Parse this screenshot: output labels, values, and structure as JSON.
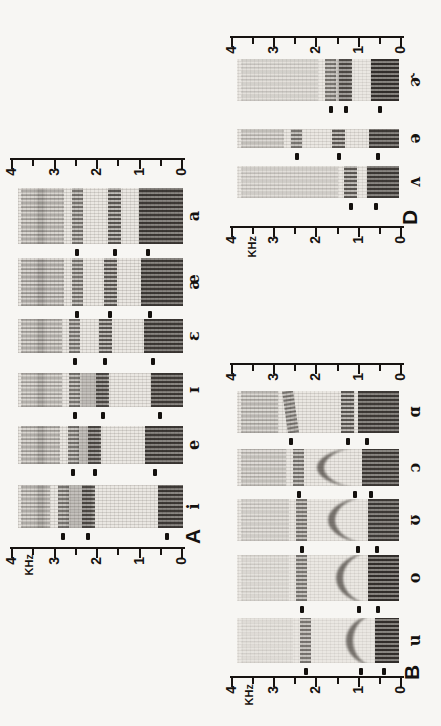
{
  "page": {
    "background": "#f7f6f3",
    "ink": "#171310",
    "strip_base": "#eae7e2"
  },
  "chart_data": {
    "type": "heatmap",
    "subtype": "speech_spectrograms_of_vowels",
    "orientation": "figure_rotated_90deg_ccw_on_page",
    "frequency_axis": {
      "label": "KHz",
      "min": 0,
      "max": 4,
      "tick_labels": [
        "4",
        "3",
        "2",
        "1",
        "0"
      ],
      "minor_tick_step": 0.5
    },
    "panels": [
      {
        "label": "A",
        "vowels": [
          {
            "ipa": "i",
            "formants_khz": [
              0.35,
              2.21,
              2.8
            ],
            "trajectory": "flat",
            "high_freq_energy": 0.65
          },
          {
            "ipa": "e",
            "formants_khz": [
              0.64,
              2.05,
              2.56
            ],
            "trajectory": "flat",
            "high_freq_energy": 0.65
          },
          {
            "ipa": "ɪ",
            "formants_khz": [
              0.52,
              1.86,
              2.52
            ],
            "trajectory": "flat",
            "high_freq_energy": 0.6
          },
          {
            "ipa": "ɛ",
            "formants_khz": [
              0.68,
              1.81,
              2.52
            ],
            "trajectory": "flat",
            "high_freq_energy": 0.65
          },
          {
            "ipa": "æ",
            "formants_khz": [
              0.75,
              1.69,
              2.47
            ],
            "trajectory": "flat",
            "high_freq_energy": 0.7
          },
          {
            "ipa": "a",
            "formants_khz": [
              0.8,
              1.58,
              2.47
            ],
            "trajectory": "flat",
            "high_freq_energy": 0.65
          }
        ]
      },
      {
        "label": "B",
        "vowels": [
          {
            "ipa": "u",
            "formants_khz": [
              0.4,
              0.95,
              2.25
            ],
            "trajectory": "arch",
            "high_freq_energy": 0.12
          },
          {
            "ipa": "o",
            "formants_khz": [
              0.55,
              1.0,
              2.35
            ],
            "trajectory": "arch",
            "high_freq_energy": 0.18
          },
          {
            "ipa": "ʊ",
            "formants_khz": [
              0.56,
              1.02,
              2.35
            ],
            "trajectory": "arch",
            "high_freq_energy": 0.3
          },
          {
            "ipa": "ɔ",
            "formants_khz": [
              0.7,
              1.09,
              2.42
            ],
            "trajectory": "arch",
            "high_freq_energy": 0.45
          },
          {
            "ipa": "ɑ",
            "formants_khz": [
              0.8,
              1.26,
              2.61
            ],
            "trajectory": "rise",
            "high_freq_energy": 0.55
          }
        ]
      },
      {
        "label": "D",
        "vowels": [
          {
            "ipa": "ʌ",
            "formants_khz": [
              0.58,
              1.19
            ],
            "trajectory": "flat",
            "high_freq_energy": 0.3
          },
          {
            "ipa": "ə",
            "formants_khz": [
              0.54,
              1.47,
              2.46
            ],
            "trajectory": "flat",
            "high_freq_energy": 0.45
          },
          {
            "ipa": "ɚ",
            "formants_khz": [
              0.49,
              1.31,
              1.66
            ],
            "trajectory": "flat",
            "high_freq_energy": 0.25
          }
        ]
      }
    ]
  }
}
